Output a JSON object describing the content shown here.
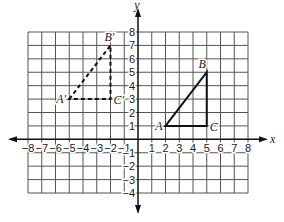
{
  "diagram": {
    "type": "coordinate-plane-translation",
    "axes": {
      "x_label": "x",
      "y_label": "y",
      "x_range": [
        -8,
        8
      ],
      "y_range": [
        -4,
        8
      ],
      "x_ticks": [
        "-8",
        "-7",
        "-6",
        "-5",
        "-4",
        "-3",
        "-2",
        "-1",
        "1",
        "2",
        "3",
        "4",
        "5",
        "6",
        "7",
        "8"
      ],
      "y_ticks": [
        "8",
        "7",
        "6",
        "5",
        "4",
        "3",
        "2",
        "1",
        "-1",
        "-2",
        "-3",
        "-4"
      ]
    },
    "grid": {
      "cell_size": 1,
      "color": "#555555"
    },
    "original_triangle": {
      "style": "solid",
      "color": "#111111",
      "vertices": [
        {
          "label": "A",
          "x": 2,
          "y": 1
        },
        {
          "label": "B",
          "x": 5,
          "y": 5
        },
        {
          "label": "C",
          "x": 5,
          "y": 1
        }
      ]
    },
    "image_triangle": {
      "style": "dashed",
      "color": "#111111",
      "vertices": [
        {
          "label": "A′",
          "x": -5,
          "y": 3
        },
        {
          "label": "B′",
          "x": -2,
          "y": 7
        },
        {
          "label": "C′",
          "x": -2,
          "y": 3
        }
      ]
    }
  }
}
